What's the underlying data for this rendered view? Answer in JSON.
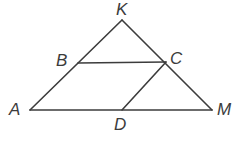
{
  "figure": {
    "kind": "geometry-diagram",
    "background_color": "#ffffff",
    "stroke_color": "#3c3c3c",
    "label_color": "#3c3c3c",
    "stroke_width": 1.6,
    "labels": {
      "K": "K",
      "B": "B",
      "C": "C",
      "A": "A",
      "D": "D",
      "M": "M"
    },
    "points": [
      {
        "name": "A",
        "x": 30,
        "y": 110
      },
      {
        "name": "K",
        "x": 122,
        "y": 20
      },
      {
        "name": "M",
        "x": 212,
        "y": 110
      },
      {
        "name": "B",
        "x": 78,
        "y": 63
      },
      {
        "name": "C",
        "x": 166,
        "y": 62
      },
      {
        "name": "D",
        "x": 122,
        "y": 110
      }
    ],
    "segments": [
      {
        "name": "side-AK",
        "from": "A",
        "to": "K",
        "x1": 30,
        "y1": 110,
        "x2": 122,
        "y2": 20
      },
      {
        "name": "side-KM",
        "from": "K",
        "to": "M",
        "x1": 122,
        "y1": 20,
        "x2": 212,
        "y2": 110
      },
      {
        "name": "side-AM",
        "from": "A",
        "to": "M",
        "x1": 30,
        "y1": 110,
        "x2": 212,
        "y2": 110
      },
      {
        "name": "segment-BC",
        "from": "B",
        "to": "C",
        "x1": 78,
        "y1": 63,
        "x2": 166,
        "y2": 62
      },
      {
        "name": "segment-DC",
        "from": "D",
        "to": "C",
        "x1": 122,
        "y1": 110,
        "x2": 166,
        "y2": 62
      }
    ]
  }
}
